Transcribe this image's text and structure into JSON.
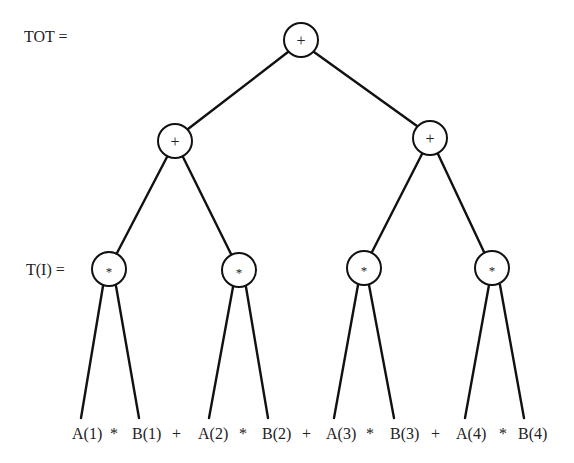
{
  "diagram": {
    "type": "expression-tree",
    "labels": {
      "root": "TOT =",
      "level3": "T(I) ="
    },
    "nodes": [
      {
        "id": "root",
        "op": "+",
        "x": 301,
        "y": 40
      },
      {
        "id": "left-sum",
        "op": "+",
        "x": 175,
        "y": 141
      },
      {
        "id": "right-sum",
        "op": "+",
        "x": 430,
        "y": 138
      },
      {
        "id": "mul-1",
        "op": "*",
        "x": 109,
        "y": 269
      },
      {
        "id": "mul-2",
        "op": "*",
        "x": 239,
        "y": 270
      },
      {
        "id": "mul-3",
        "op": "*",
        "x": 364,
        "y": 268
      },
      {
        "id": "mul-4",
        "op": "*",
        "x": 492,
        "y": 268
      }
    ],
    "expression": {
      "tokens": [
        "A(1)",
        "*",
        "B(1)",
        "+",
        "A(2)",
        "*",
        "B(2)",
        "+",
        "A(3)",
        "*",
        "B(3)",
        "+",
        "A(4)",
        "*",
        "B(4)"
      ]
    }
  }
}
